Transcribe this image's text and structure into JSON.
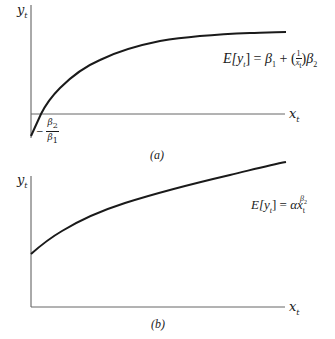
{
  "panels": [
    {
      "id": "a",
      "caption": "(a)",
      "y_axis_label": "y",
      "y_axis_sub": "t",
      "x_axis_label": "x",
      "x_axis_sub": "t",
      "equation": {
        "lhs": "E[y",
        "lhs_sub": "t",
        "lhs_close": "] = ",
        "b1": "β",
        "b1_sub": "1",
        "plus": " + ",
        "frac_num": "1",
        "frac_den": "x",
        "frac_den_sub": "t",
        "b2": "β",
        "b2_sub": "2"
      },
      "intercept_label": {
        "minus": "−",
        "num": "β",
        "num_sub": "2",
        "den": "β",
        "den_sub": "1"
      }
    },
    {
      "id": "b",
      "caption": "(b)",
      "y_axis_label": "y",
      "y_axis_sub": "t",
      "x_axis_label": "x",
      "x_axis_sub": "t",
      "equation": {
        "lhs": "E[y",
        "lhs_sub": "t",
        "lhs_close": "] = ",
        "alpha": "α",
        "x": "x",
        "x_sub": "t",
        "exp": "β",
        "exp_sub": "2"
      }
    }
  ],
  "colors": {
    "curve": "#1a1a1a",
    "axis": "#555555"
  }
}
